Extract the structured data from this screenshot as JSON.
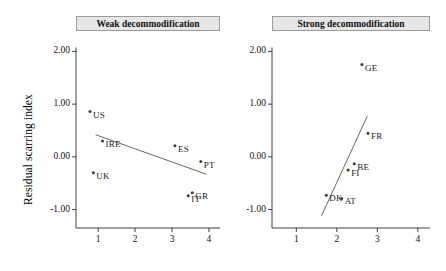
{
  "figure": {
    "width": 446,
    "height": 271,
    "background": "#ffffff",
    "ylabel": "Residual scarring index",
    "strip_fill": "#e6e6e6",
    "line_color": "#555555",
    "marker_color": "#3a3a3a"
  },
  "chart_data": {
    "type": "scatter",
    "title": "",
    "xlabel": "",
    "ylabel": "Residual scarring index",
    "xlim": [
      0.4,
      4.3
    ],
    "ylim": [
      -1.35,
      2.35
    ],
    "xticks": [
      "1",
      "2",
      "3",
      "4"
    ],
    "xtick_values": [
      1,
      2,
      3,
      4
    ],
    "yticks": [
      "2.00",
      "1.00",
      "0.00",
      "-1.00"
    ],
    "ytick_values": [
      2.0,
      1.0,
      0.0,
      -1.0
    ],
    "grid": false,
    "legend": "none",
    "panels": [
      {
        "label": "Weak decommodification",
        "points": [
          {
            "name": "US",
            "x": 0.78,
            "y": 0.86
          },
          {
            "name": "IRE",
            "x": 1.12,
            "y": 0.3
          },
          {
            "name": "UK",
            "x": 0.87,
            "y": -0.3
          },
          {
            "name": "ES",
            "x": 3.08,
            "y": 0.21
          },
          {
            "name": "PT",
            "x": 3.78,
            "y": -0.09
          },
          {
            "name": "GR",
            "x": 3.55,
            "y": -0.68
          },
          {
            "name": "IT",
            "x": 3.44,
            "y": -0.74
          }
        ],
        "fit_line": {
          "x0": 0.93,
          "y0": 0.42,
          "x1": 3.93,
          "y1": -0.33
        }
      },
      {
        "label": "Strong decommodification",
        "points": [
          {
            "name": "GE",
            "x": 2.62,
            "y": 1.75
          },
          {
            "name": "FR",
            "x": 2.77,
            "y": 0.45
          },
          {
            "name": "BE",
            "x": 2.43,
            "y": -0.13
          },
          {
            "name": "FI",
            "x": 2.28,
            "y": -0.25
          },
          {
            "name": "DK",
            "x": 1.74,
            "y": -0.73
          },
          {
            "name": "AT",
            "x": 2.12,
            "y": -0.79
          }
        ],
        "fit_line": {
          "x0": 1.62,
          "y0": -1.12,
          "x1": 2.75,
          "y1": 0.77
        }
      }
    ]
  }
}
